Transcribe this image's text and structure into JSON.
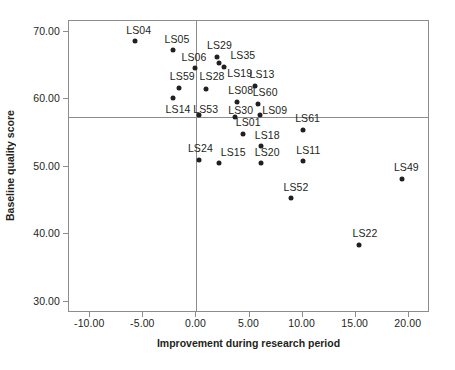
{
  "chart_data": {
    "type": "scatter",
    "title": "",
    "xlabel": "Improvement during research period",
    "ylabel": "Baseline quality score",
    "xlim": [
      -12.0,
      22.0
    ],
    "ylim": [
      28.3,
      71.6
    ],
    "xticks": [
      "-10.00",
      "-5.00",
      "0.00",
      "5.00",
      "10.00",
      "15.00",
      "20.00"
    ],
    "xtick_values": [
      -10,
      -5,
      0,
      5,
      10,
      15,
      20
    ],
    "yticks": [
      "70.00",
      "60.00",
      "50.00",
      "40.00",
      "30.00"
    ],
    "ytick_values": [
      70,
      60,
      50,
      40,
      30
    ],
    "grid": false,
    "legend": false,
    "reference_lines": {
      "vertical_x": 0.0,
      "horizontal_y": 57.4
    },
    "point_color": "#231f20",
    "axis_color": "#8c8c8c",
    "points": [
      {
        "label": "LS04",
        "x": -5.8,
        "y": 68.6,
        "lx": -6.6,
        "ly": 70.3
      },
      {
        "label": "LS05",
        "x": -2.2,
        "y": 67.3,
        "lx": -3.0,
        "ly": 69.0
      },
      {
        "label": "LS29",
        "x": 1.9,
        "y": 66.3,
        "lx": 1.0,
        "ly": 68.0
      },
      {
        "label": "LS35",
        "x": 2.6,
        "y": 64.8,
        "lx": 3.2,
        "ly": 66.5
      },
      {
        "label": "LS06",
        "x": -0.1,
        "y": 64.6,
        "lx": -1.4,
        "ly": 66.3
      },
      {
        "label": "LS19",
        "x": 2.1,
        "y": 65.3,
        "lx": 2.9,
        "ly": 63.9
      },
      {
        "label": "LS13",
        "x": 5.5,
        "y": 61.9,
        "lx": 5.0,
        "ly": 63.8
      },
      {
        "label": "LS59",
        "x": -1.6,
        "y": 61.6,
        "lx": -2.5,
        "ly": 63.4
      },
      {
        "label": "LS28",
        "x": 0.9,
        "y": 61.5,
        "lx": 0.3,
        "ly": 63.4
      },
      {
        "label": "LS08",
        "x": 3.8,
        "y": 59.6,
        "lx": 3.0,
        "ly": 61.3
      },
      {
        "label": "LS60",
        "x": 5.8,
        "y": 59.3,
        "lx": 5.3,
        "ly": 61.1
      },
      {
        "label": "LS14",
        "x": -2.2,
        "y": 60.2,
        "lx": -2.9,
        "ly": 58.5
      },
      {
        "label": "LS53",
        "x": 0.2,
        "y": 57.7,
        "lx": -0.3,
        "ly": 58.5
      },
      {
        "label": "LS30",
        "x": 3.6,
        "y": 57.4,
        "lx": 3.0,
        "ly": 58.4
      },
      {
        "label": "LS09",
        "x": 6.0,
        "y": 57.6,
        "lx": 6.2,
        "ly": 58.4
      },
      {
        "label": "LS01",
        "x": 4.4,
        "y": 54.9,
        "lx": 3.7,
        "ly": 56.6
      },
      {
        "label": "LS61",
        "x": 10.0,
        "y": 55.5,
        "lx": 9.3,
        "ly": 57.2
      },
      {
        "label": "LS18",
        "x": 6.1,
        "y": 53.0,
        "lx": 5.5,
        "ly": 54.7
      },
      {
        "label": "LS24",
        "x": 0.2,
        "y": 51.0,
        "lx": -0.8,
        "ly": 52.7
      },
      {
        "label": "LS15",
        "x": 2.1,
        "y": 50.5,
        "lx": 2.3,
        "ly": 52.2
      },
      {
        "label": "LS20",
        "x": 6.1,
        "y": 50.5,
        "lx": 5.5,
        "ly": 52.2
      },
      {
        "label": "LS11",
        "x": 10.0,
        "y": 50.8,
        "lx": 9.4,
        "ly": 52.5
      },
      {
        "label": "LS49",
        "x": 19.4,
        "y": 48.2,
        "lx": 18.6,
        "ly": 49.9
      },
      {
        "label": "LS52",
        "x": 8.9,
        "y": 45.3,
        "lx": 8.2,
        "ly": 47.0
      },
      {
        "label": "LS22",
        "x": 15.3,
        "y": 38.4,
        "lx": 14.7,
        "ly": 40.1
      }
    ]
  }
}
